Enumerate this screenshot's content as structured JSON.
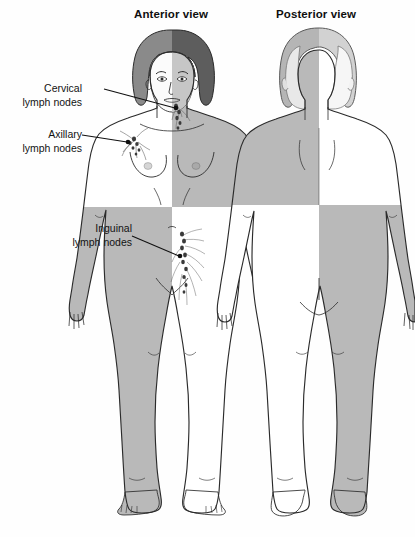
{
  "figure": {
    "kind": "anatomical-diagram",
    "background_color": "#ffffff",
    "outline_color": "#2b2b2b",
    "shade_color": "#b9b9b9",
    "hair_color": "#6f6f6f",
    "node_color": "#3a3a3a"
  },
  "titles": {
    "anterior": "Anterior view",
    "posterior": "Posterior view"
  },
  "labels": [
    {
      "id": "cervical",
      "line1": "Cervical",
      "line2": "lymph nodes",
      "leader_from": [
        104,
        89
      ],
      "leader_to": [
        175,
        108
      ]
    },
    {
      "id": "axillary",
      "line1": "Axillary",
      "line2": "lymph nodes",
      "leader_from": [
        82,
        135
      ],
      "leader_to": [
        127,
        142
      ]
    },
    {
      "id": "inguinal",
      "line1": "Inguinal",
      "line2": "lymph nodes",
      "leader_from": [
        132,
        236
      ],
      "leader_to": [
        179,
        256
      ]
    }
  ],
  "views": [
    {
      "name": "anterior",
      "quadrants": [
        {
          "position": "upper-left",
          "shaded": false
        },
        {
          "position": "upper-right",
          "shaded": true
        },
        {
          "position": "lower-left",
          "shaded": true
        },
        {
          "position": "lower-right",
          "shaded": false
        }
      ],
      "waist_y": 207,
      "node_clusters": [
        "cervical",
        "axillary",
        "inguinal"
      ]
    },
    {
      "name": "posterior",
      "quadrants": [
        {
          "position": "upper-left",
          "shaded": true
        },
        {
          "position": "upper-right",
          "shaded": false
        },
        {
          "position": "lower-left",
          "shaded": false
        },
        {
          "position": "lower-right",
          "shaded": true
        }
      ],
      "waist_y": 205,
      "node_clusters": []
    }
  ]
}
